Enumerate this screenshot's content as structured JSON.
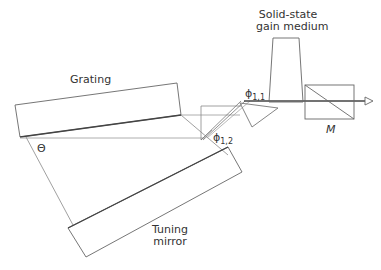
{
  "diagram": {
    "type": "optical-setup",
    "labels": {
      "grating": "Grating",
      "gain_medium_line1": "Solid-state",
      "gain_medium_line2": "gain medium",
      "tuning_mirror_line1": "Tuning",
      "tuning_mirror_line2": "mirror",
      "theta": "Θ",
      "phi11_base": "ϕ",
      "phi11_sub": "1,1",
      "phi12_base": "ϕ",
      "phi12_sub": "1,2",
      "output_mirror": "M"
    },
    "components": [
      {
        "name": "grating",
        "shape": "rotated-rectangle"
      },
      {
        "name": "tuning-mirror",
        "shape": "rotated-rectangle"
      },
      {
        "name": "prism-1",
        "shape": "triangle"
      },
      {
        "name": "prism-2",
        "shape": "triangle"
      },
      {
        "name": "gain-medium",
        "shape": "trapezoid"
      },
      {
        "name": "output-coupler-M",
        "shape": "rectangle-with-diagonal"
      },
      {
        "name": "output-beam-arrow",
        "shape": "arrow"
      }
    ],
    "colors": {
      "stroke": "#555555",
      "beam": "#444444",
      "light": "#aaaaaa"
    }
  }
}
